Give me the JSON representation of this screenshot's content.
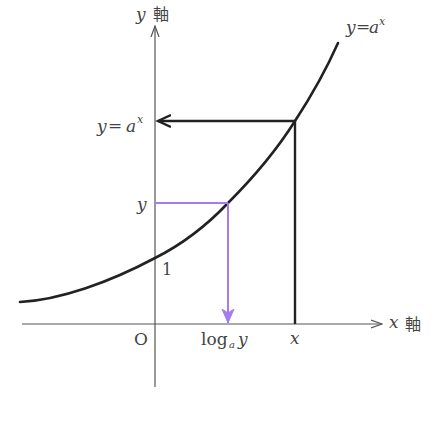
{
  "diagram": {
    "colors": {
      "axis": "#555555",
      "curve": "#222222",
      "guide_black": "#222222",
      "guide_purple": "#a57cf0",
      "text": "#444444"
    },
    "axes": {
      "y_axis_label_var": "y",
      "y_axis_label_kanji": "軸",
      "x_axis_label_var": "x",
      "x_axis_label_kanji": "軸",
      "origin_label": "O"
    },
    "curve": {
      "label_y": "y",
      "label_eq": "=",
      "label_base": "a",
      "label_exp": "x",
      "y_intercept_label": "1"
    },
    "y_ticks": {
      "upper_y": "y",
      "upper_eq": "=",
      "upper_base": "a",
      "upper_exp": "x",
      "lower": "y"
    },
    "x_ticks": {
      "log_text": "log",
      "log_sub": "a",
      "log_arg": "y",
      "x": "x"
    }
  }
}
